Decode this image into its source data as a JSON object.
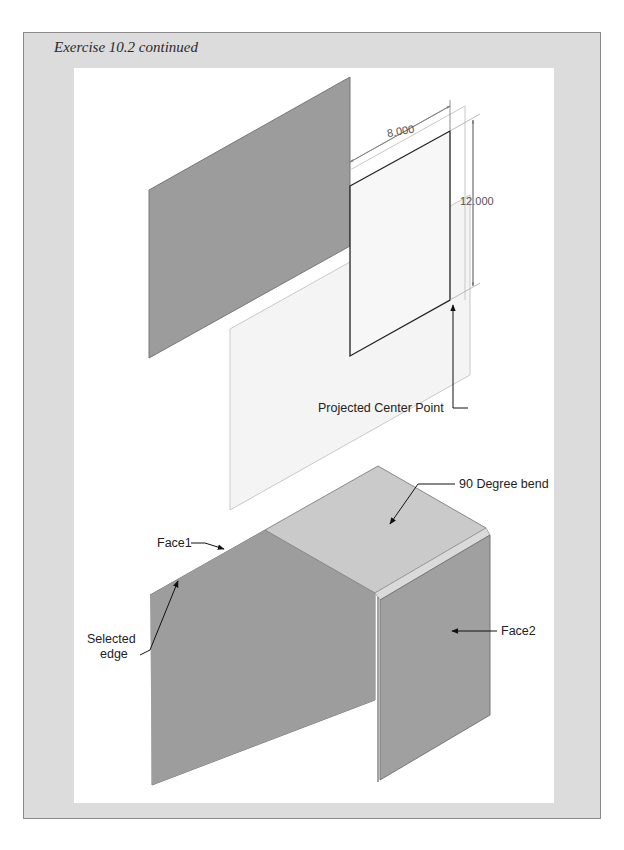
{
  "page": {
    "title": "Exercise 10.2 continued"
  },
  "figure_top": {
    "dimension_width": "8.000",
    "dimension_height": "12.000",
    "callout_projected_center": "Projected Center Point"
  },
  "figure_bottom": {
    "callout_bend": "90 Degree bend",
    "callout_face1": "Face1",
    "callout_selected_edge_line1": "Selected",
    "callout_selected_edge_line2": "edge",
    "callout_face2": "Face2"
  },
  "colors": {
    "frame_bg": "#dcdcdc",
    "plate_dark": "#9a9a9a",
    "plate_top": "#c6c6c6",
    "sketch_plane": "#f3f3f3"
  }
}
